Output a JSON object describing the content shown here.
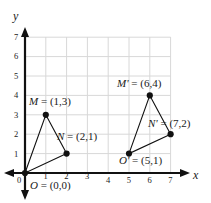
{
  "chart_data": {
    "type": "scatter",
    "title": "",
    "xlabel": "x",
    "ylabel": "y",
    "xlim": [
      0,
      7
    ],
    "ylim": [
      0,
      7
    ],
    "grid": true,
    "legend": "none",
    "x_ticks": [
      "0",
      "1",
      "2",
      "3",
      "4",
      "5",
      "6",
      "7"
    ],
    "y_ticks": [
      "1",
      "2",
      "3",
      "4",
      "5",
      "6",
      "7"
    ],
    "series": [
      {
        "name": "Triangle MNO",
        "points": [
          {
            "label": "M",
            "x": 1,
            "y": 3
          },
          {
            "label": "N",
            "x": 2,
            "y": 1
          },
          {
            "label": "O",
            "x": 0,
            "y": 0
          }
        ]
      },
      {
        "name": "Triangle M'N'O'",
        "points": [
          {
            "label": "M'",
            "x": 6,
            "y": 4
          },
          {
            "label": "N'",
            "x": 7,
            "y": 2
          },
          {
            "label": "O'",
            "x": 5,
            "y": 1
          }
        ]
      }
    ],
    "annotations": [
      {
        "name": "label-M",
        "text": "M = (1,3)",
        "point": "M"
      },
      {
        "name": "label-N",
        "text": "N = (2,1)",
        "point": "N"
      },
      {
        "name": "label-O",
        "text": "O = (0,0)",
        "point": "O"
      },
      {
        "name": "label-Mp",
        "text": "M' = (6,4)",
        "point": "M'"
      },
      {
        "name": "label-Np",
        "text": "N' = (7,2)",
        "point": "N'"
      },
      {
        "name": "label-Op",
        "text": "O' = (5,1)",
        "point": "O'"
      }
    ],
    "colors": {
      "grid": "#d8d8d8",
      "axis": "#111111",
      "shape_stroke": "#111111",
      "point_fill": "#111111",
      "background": "#ffffff"
    }
  },
  "axes": {
    "x_name": "x",
    "y_name": "y",
    "x_ticks": [
      "0",
      "1",
      "2",
      "3",
      "4",
      "5",
      "6",
      "7"
    ],
    "y_ticks": [
      "7",
      "6",
      "5",
      "4",
      "3",
      "2",
      "1"
    ]
  },
  "labels": {
    "M": "M = (1,3)",
    "N": "N = (2,1)",
    "O": "O = (0,0)",
    "Mp": "M' = (6,4)",
    "Np": "N' = (7,2)",
    "Op": "O' = (5,1)"
  }
}
